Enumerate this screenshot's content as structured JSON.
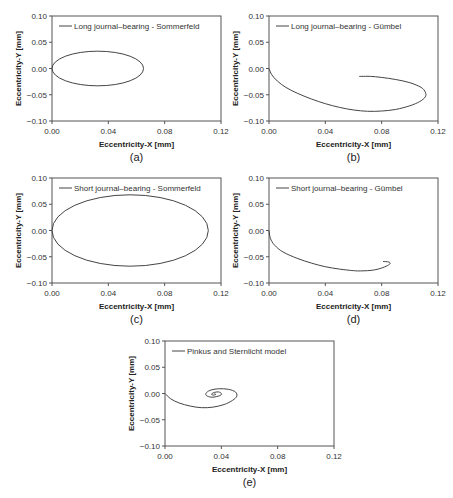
{
  "chart_data": [
    {
      "id": "a",
      "type": "line",
      "caption": "(a)",
      "legend": "Long journal–bearing - Sommerfeld",
      "xlabel": "Eccentricity-X [mm]",
      "ylabel": "Eccentricity-Y [mm]",
      "xlim": [
        0.0,
        0.12
      ],
      "ylim": [
        -0.1,
        0.1
      ],
      "xticks": [
        "0.00",
        "0.04",
        "0.08",
        "0.12"
      ],
      "yticks": [
        "0.10",
        "0.05",
        "0.00",
        "−0.05",
        "−0.10"
      ],
      "grid": false,
      "legend_position": "upper-left",
      "series": [
        {
          "name": "Long journal–bearing - Sommerfeld",
          "shape": "ellipse",
          "center": [
            0.0325,
            0.0
          ],
          "radii": [
            0.0325,
            0.033
          ],
          "x": [
            0.0,
            0.0044,
            0.0163,
            0.0325,
            0.0487,
            0.0606,
            0.065,
            0.0606,
            0.0487,
            0.0325,
            0.0163,
            0.0044,
            0.0
          ],
          "y": [
            0.0,
            0.0165,
            0.0286,
            0.033,
            0.0286,
            0.0165,
            0.0,
            -0.0165,
            -0.0286,
            -0.033,
            -0.0286,
            -0.0165,
            0.0
          ]
        }
      ]
    },
    {
      "id": "b",
      "type": "line",
      "caption": "(b)",
      "legend": "Long journal–bearing - Gümbel",
      "xlabel": "Eccentricity-X [mm]",
      "ylabel": "Eccentricity-Y [mm]",
      "xlim": [
        0.0,
        0.12
      ],
      "ylim": [
        -0.1,
        0.1
      ],
      "xticks": [
        "0.00",
        "0.04",
        "0.08",
        "0.12"
      ],
      "yticks": [
        "0.10",
        "0.05",
        "0.00",
        "−0.05",
        "−0.10"
      ],
      "grid": false,
      "legend_position": "upper-left",
      "series": [
        {
          "name": "Long journal–bearing - Gümbel",
          "x": [
            0.0,
            0.002,
            0.006,
            0.012,
            0.02,
            0.03,
            0.04,
            0.05,
            0.06,
            0.07,
            0.08,
            0.09,
            0.1,
            0.107,
            0.111,
            0.111,
            0.108,
            0.1,
            0.09,
            0.08,
            0.072,
            0.066,
            0.064
          ],
          "y": [
            0.0,
            -0.012,
            -0.024,
            -0.036,
            -0.047,
            -0.058,
            -0.067,
            -0.074,
            -0.079,
            -0.0815,
            -0.081,
            -0.078,
            -0.071,
            -0.063,
            -0.054,
            -0.045,
            -0.036,
            -0.027,
            -0.021,
            -0.017,
            -0.015,
            -0.015,
            -0.015
          ]
        }
      ]
    },
    {
      "id": "c",
      "type": "line",
      "caption": "(c)",
      "legend": "Short journal–bearing - Sommerfeld",
      "xlabel": "Eccentricity-X [mm]",
      "ylabel": "Eccentricity-Y [mm]",
      "xlim": [
        0.0,
        0.12
      ],
      "ylim": [
        -0.1,
        0.1
      ],
      "xticks": [
        "0.00",
        "0.04",
        "0.08",
        "0.12"
      ],
      "yticks": [
        "0.10",
        "0.05",
        "0.00",
        "−0.05",
        "−0.10"
      ],
      "grid": false,
      "legend_position": "upper-left",
      "series": [
        {
          "name": "Short journal–bearing - Sommerfeld",
          "shape": "ellipse",
          "center": [
            0.0555,
            0.0
          ],
          "radii": [
            0.0555,
            0.068
          ],
          "x": [
            0.0,
            0.0074,
            0.0278,
            0.0555,
            0.0832,
            0.1036,
            0.111,
            0.1036,
            0.0832,
            0.0555,
            0.0278,
            0.0074,
            0.0
          ],
          "y": [
            0.0,
            0.034,
            0.0589,
            0.068,
            0.0589,
            0.034,
            0.0,
            -0.034,
            -0.0589,
            -0.068,
            -0.0589,
            -0.034,
            0.0
          ]
        }
      ]
    },
    {
      "id": "d",
      "type": "line",
      "caption": "(d)",
      "legend": "Short journal–bearing - Gümbel",
      "xlabel": "Eccentricity-X [mm]",
      "ylabel": "Eccentricity-Y [mm]",
      "xlim": [
        0.0,
        0.12
      ],
      "ylim": [
        -0.1,
        0.1
      ],
      "xticks": [
        "0.00",
        "0.04",
        "0.08",
        "0.12"
      ],
      "yticks": [
        "0.10",
        "0.05",
        "0.00",
        "−0.05",
        "−0.10"
      ],
      "grid": false,
      "legend_position": "upper-left",
      "series": [
        {
          "name": "Short journal–bearing - Gümbel",
          "x": [
            0.0,
            0.001,
            0.004,
            0.01,
            0.02,
            0.03,
            0.04,
            0.05,
            0.06,
            0.065,
            0.07,
            0.075,
            0.08,
            0.084,
            0.086,
            0.085,
            0.081
          ],
          "y": [
            0.0,
            -0.015,
            -0.028,
            -0.041,
            -0.053,
            -0.062,
            -0.069,
            -0.0735,
            -0.0765,
            -0.077,
            -0.0765,
            -0.075,
            -0.0715,
            -0.067,
            -0.063,
            -0.06,
            -0.059
          ]
        }
      ]
    },
    {
      "id": "e",
      "type": "line",
      "caption": "(e)",
      "legend": "Pinkus and Sternlicht model",
      "xlabel": "Eccentricity-X [mm]",
      "ylabel": "Eccentricity-Y [mm]",
      "xlim": [
        0.0,
        0.12
      ],
      "ylim": [
        -0.1,
        0.1
      ],
      "xticks": [
        "0.00",
        "0.04",
        "0.08",
        "0.12"
      ],
      "yticks": [
        "0.10",
        "0.05",
        "0.00",
        "−0.05",
        "−0.10"
      ],
      "grid": false,
      "legend_position": "upper-left",
      "series": [
        {
          "name": "Pinkus and Sternlicht model",
          "shape": "spiral",
          "x": [
            0.0,
            0.004,
            0.01,
            0.018,
            0.026,
            0.034,
            0.042,
            0.048,
            0.051,
            0.05,
            0.045,
            0.038,
            0.032,
            0.029,
            0.03,
            0.034,
            0.039,
            0.04,
            0.038,
            0.035,
            0.033,
            0.034,
            0.036,
            0.035
          ],
          "y": [
            0.0,
            -0.01,
            -0.018,
            -0.024,
            -0.027,
            -0.026,
            -0.021,
            -0.013,
            -0.005,
            0.003,
            0.008,
            0.009,
            0.006,
            0.0,
            -0.005,
            -0.007,
            -0.004,
            0.0,
            0.003,
            0.002,
            -0.001,
            -0.003,
            -0.002,
            0.0
          ]
        }
      ]
    }
  ],
  "figure": {
    "panels": [
      {
        "id": "a",
        "left": 0,
        "top": 0
      },
      {
        "id": "b",
        "left": 217,
        "top": 0
      },
      {
        "id": "c",
        "left": 0,
        "top": 162
      },
      {
        "id": "d",
        "left": 217,
        "top": 162
      },
      {
        "id": "e",
        "left": 113,
        "top": 325
      }
    ]
  }
}
